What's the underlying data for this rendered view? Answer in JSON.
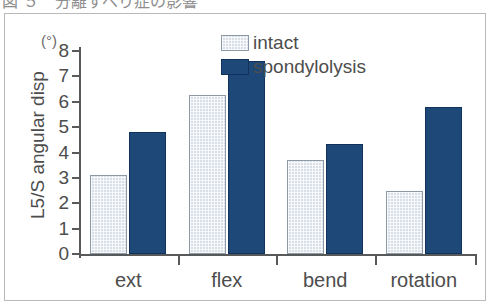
{
  "caption": {
    "top_partial_text": "図 ５　分離すべり症の影響"
  },
  "chart_data": {
    "type": "bar",
    "title": "",
    "xlabel": "",
    "ylabel": "L5/S angular disp",
    "yunit": "(°)",
    "categories": [
      "ext",
      "flex",
      "bend",
      "rotation"
    ],
    "ylim": [
      0,
      8
    ],
    "ytick_labels": [
      "8",
      "7",
      "6",
      "5",
      "4",
      "3",
      "2",
      "1",
      "0"
    ],
    "ytick_values": [
      8,
      7,
      6,
      5,
      4,
      3,
      2,
      1,
      0
    ],
    "grid": false,
    "legend_position": "top-right",
    "series": [
      {
        "name": "intact",
        "color": "#d8dfe8",
        "edge_color": "#8e99a6",
        "values": [
          3.1,
          6.25,
          3.7,
          2.5
        ]
      },
      {
        "name": "spondylolysis",
        "color": "#1d4877",
        "edge_color": "#11325a",
        "values": [
          4.8,
          7.6,
          4.35,
          5.8
        ]
      }
    ]
  },
  "style": {
    "frame_color": "#b9b9b9",
    "axis_color": "#58595b",
    "text_color": "#4d4d4d",
    "background": "#ffffff"
  }
}
